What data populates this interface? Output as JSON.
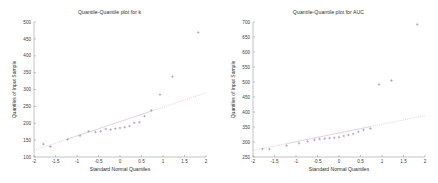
{
  "figure": {
    "background_color": "#ffffff",
    "marker_color": "#9b7fb5",
    "reference_line_color": "#c9a9c9",
    "axis_color": "#9a9a9a",
    "text_color": "#2b2b2b"
  },
  "chart_data": [
    {
      "type": "scatter",
      "title": "Quantile-Quantile plot for k",
      "xlabel": "Standard Normal Quantiles",
      "ylabel": "Quantiles of Input Sample",
      "xlim": [
        -2,
        2
      ],
      "ylim": [
        100,
        500
      ],
      "xticks": [
        -2,
        -1.5,
        -1,
        -0.5,
        0,
        0.5,
        1,
        1.5,
        2
      ],
      "xticklabels": [
        "-2",
        "-1.5",
        "-1",
        "-0.5",
        "0",
        "0.5",
        "1",
        "1.5",
        "2"
      ],
      "yticks": [
        100,
        150,
        200,
        250,
        300,
        350,
        400,
        450,
        500
      ],
      "yticklabels": [
        "100",
        "150",
        "200",
        "250",
        "300",
        "350",
        "400",
        "450",
        "500"
      ],
      "grid": false,
      "legend": "none",
      "series": [
        {
          "name": "Sample quantiles",
          "marker": "plus",
          "x": [
            -1.78,
            -1.62,
            -1.22,
            -0.93,
            -0.73,
            -0.57,
            -0.45,
            -0.33,
            -0.22,
            -0.11,
            0.0,
            0.11,
            0.22,
            0.33,
            0.45,
            0.57,
            0.73,
            0.93,
            1.22,
            1.82
          ],
          "y": [
            138,
            131,
            152,
            163,
            176,
            174,
            176,
            183,
            181,
            184,
            186,
            188,
            192,
            201,
            203,
            221,
            238,
            285,
            338,
            469
          ]
        },
        {
          "name": "Reference line",
          "type": "line",
          "x": [
            -2,
            2
          ],
          "y": [
            120,
            290
          ]
        }
      ]
    },
    {
      "type": "scatter",
      "title": "Quantile-Quantile plot for AUC",
      "xlabel": "Standard Normal Quantiles",
      "ylabel": "Quantiles of Input Sample",
      "xlim": [
        -2,
        2
      ],
      "ylim": [
        250,
        700
      ],
      "xticks": [
        -2,
        -1.5,
        -1,
        -0.5,
        0,
        0.5,
        1,
        1.5,
        2
      ],
      "xticklabels": [
        "-2",
        "-1.5",
        "-1",
        "-0.5",
        "0",
        "0.5",
        "1",
        "1.5",
        "2"
      ],
      "yticks": [
        250,
        300,
        350,
        400,
        450,
        500,
        550,
        600,
        650,
        700
      ],
      "yticklabels": [
        "250",
        "300",
        "350",
        "400",
        "450",
        "500",
        "550",
        "600",
        "650",
        "700"
      ],
      "grid": false,
      "legend": "none",
      "series": [
        {
          "name": "Sample quantiles",
          "marker": "plus",
          "x": [
            -1.78,
            -1.62,
            -1.22,
            -0.93,
            -0.73,
            -0.57,
            -0.45,
            -0.33,
            -0.22,
            -0.11,
            0.0,
            0.11,
            0.22,
            0.33,
            0.45,
            0.57,
            0.73,
            0.93,
            1.22,
            1.82
          ],
          "y": [
            277,
            276,
            288,
            296,
            302,
            307,
            310,
            311,
            313,
            314,
            316,
            320,
            323,
            327,
            334,
            340,
            345,
            492,
            505,
            692
          ]
        },
        {
          "name": "Reference line",
          "type": "line",
          "x": [
            -2,
            2
          ],
          "y": [
            272,
            388
          ]
        }
      ]
    }
  ]
}
